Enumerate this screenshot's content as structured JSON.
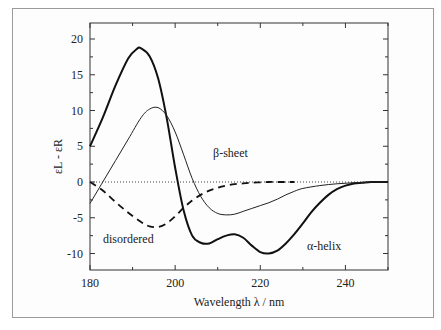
{
  "chart_data": {
    "type": "line",
    "title": "",
    "xlabel": "Wavelength  λ / nm",
    "ylabel": "εL - εR",
    "xlim": [
      180,
      250
    ],
    "ylim": [
      -12,
      22
    ],
    "xticks": [
      180,
      200,
      220,
      240
    ],
    "yticks": [
      -10,
      -5,
      0,
      5,
      10,
      15,
      20
    ],
    "xtick_labels": [
      "180",
      "200",
      "220",
      "240"
    ],
    "ytick_labels": [
      "-10",
      "-5",
      "0",
      "5",
      "10",
      "15",
      "20"
    ],
    "grid": false,
    "legend": "none (inline labels)",
    "reference_line": {
      "y": 0,
      "style": "dotted"
    },
    "series": [
      {
        "name": "α-helix",
        "style": "solid-thick",
        "x": [
          180,
          183,
          186,
          189,
          191,
          192,
          194,
          196,
          198,
          200,
          202,
          204,
          206,
          208,
          210,
          212,
          214,
          216,
          218,
          220,
          222,
          224,
          226,
          228,
          230,
          232,
          234,
          236,
          238,
          240,
          242,
          244,
          246,
          248,
          250
        ],
        "y": [
          5,
          9,
          13.5,
          17.3,
          18.6,
          18.7,
          17.6,
          14.5,
          9,
          2,
          -4,
          -7.5,
          -8.5,
          -8.6,
          -8,
          -7.5,
          -7.3,
          -7.8,
          -8.9,
          -9.8,
          -10,
          -9.6,
          -8.6,
          -7.3,
          -5.8,
          -4.2,
          -2.9,
          -1.8,
          -1,
          -0.5,
          -0.2,
          -0.1,
          0,
          0,
          0
        ]
      },
      {
        "name": "β-sheet",
        "style": "solid-thin",
        "x": [
          180,
          183,
          186,
          189,
          192,
          194,
          196,
          198,
          200,
          202,
          204,
          206,
          208,
          210,
          212,
          214,
          216,
          218,
          220,
          222,
          224,
          226,
          228,
          230,
          234,
          238,
          242,
          246,
          250
        ],
        "y": [
          -3,
          0,
          3,
          6,
          9,
          10.2,
          10.4,
          9.3,
          7,
          3.8,
          0.5,
          -2,
          -3.6,
          -4.4,
          -4.6,
          -4.5,
          -4.1,
          -3.7,
          -3.3,
          -2.9,
          -2.4,
          -1.8,
          -1.3,
          -0.9,
          -0.5,
          -0.25,
          -0.1,
          0,
          0
        ]
      },
      {
        "name": "disordered",
        "style": "dashed",
        "x": [
          180,
          183,
          186,
          189,
          192,
          194,
          196,
          198,
          200,
          202,
          204,
          206,
          208,
          210,
          212,
          214,
          216,
          218,
          220,
          222,
          224,
          226,
          228
        ],
        "y": [
          0,
          -1.2,
          -2.8,
          -4.3,
          -5.6,
          -6.2,
          -6.3,
          -5.8,
          -4.8,
          -3.6,
          -2.6,
          -1.8,
          -1.2,
          -0.8,
          -0.5,
          -0.3,
          -0.2,
          -0.1,
          -0.05,
          0,
          0,
          0,
          0
        ]
      }
    ],
    "annotations": [
      {
        "text": "β-sheet",
        "x": 213,
        "y": 3.5
      },
      {
        "text": "disordered",
        "x": 189,
        "y": -8.5
      },
      {
        "text": "α-helix",
        "x": 235,
        "y": -9.5
      }
    ]
  }
}
